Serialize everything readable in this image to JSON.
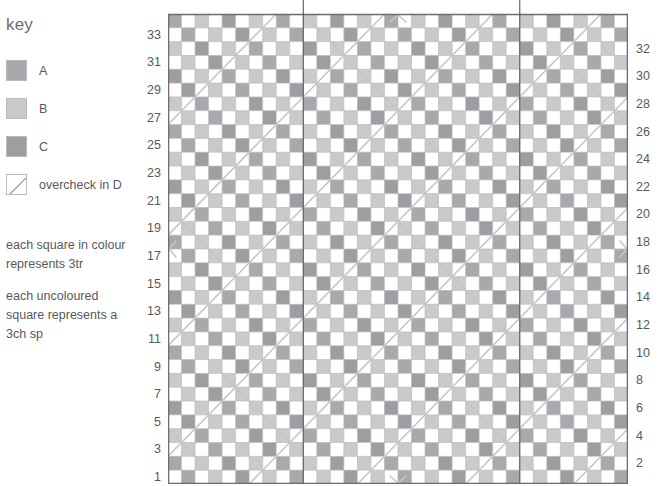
{
  "key": {
    "title": "key",
    "entries": [
      {
        "label": "A",
        "swatch": "color-swatch-a",
        "color": "#a7a9ac"
      },
      {
        "label": "B",
        "swatch": "color-swatch-b",
        "color": "#c9cacc"
      },
      {
        "label": "C",
        "swatch": "color-swatch-c",
        "color": "#9c9ea1"
      },
      {
        "label": "overcheck in D",
        "swatch": "diagonal-swatch-d",
        "color": "#ffffff"
      }
    ],
    "notes": [
      "each square in colour represents 3tr",
      "each uncoloured square represents a 3ch sp"
    ],
    "note_lines": [
      [
        "each square in colour",
        "represents 3tr"
      ],
      [
        "each uncoloured",
        "square represents a",
        "3ch sp"
      ]
    ]
  },
  "chart_data": {
    "type": "heatmap",
    "title": "",
    "xlabel": "",
    "ylabel": "",
    "grid": true,
    "legend_position": "left",
    "columns": 34,
    "rows": 34,
    "cell_size": 13.5,
    "row_labels_left": [
      33,
      31,
      29,
      27,
      25,
      23,
      21,
      19,
      17,
      15,
      13,
      11,
      9,
      7,
      5,
      3,
      1
    ],
    "row_labels_right": [
      32,
      30,
      28,
      26,
      24,
      22,
      20,
      18,
      16,
      14,
      12,
      10,
      8,
      6,
      4,
      2
    ],
    "row_label_step": 2,
    "palette": {
      "A": "#a7a9ac",
      "B": "#c9cacc",
      "C": "#9c9ea1",
      "empty": "#ffffff",
      "gridline": "#b9babc",
      "border": "#6d6e71",
      "overcheck_D": "#c4c6c8",
      "guideline": "#58595b"
    },
    "pattern": {
      "description": "checkerboard of coloured and uncoloured squares; coloured squares alternate between tones A, B and C in a repeating block",
      "block_period": 2,
      "tone_cycle": [
        "A",
        "B",
        "C",
        "B"
      ],
      "coloured_parity": "cell is coloured when (row + column) is even"
    },
    "overcheck": {
      "colour": "D",
      "line_color": "#c4c6c8",
      "line_width": 1.6,
      "spacing_cells": 8,
      "directions": [
        "down-right",
        "down-left"
      ],
      "forms_x_crossings_at": [
        {
          "col": 9,
          "row": 25
        },
        {
          "col": 25,
          "row": 25
        },
        {
          "col": 17,
          "row": 17
        },
        {
          "col": 9,
          "row": 9
        },
        {
          "col": 25,
          "row": 9
        }
      ],
      "arrow_markers": [
        {
          "x_cell": 0,
          "y_cell": 17,
          "glyph": "<"
        },
        {
          "x_cell": 34,
          "y_cell": 17,
          "glyph": ">"
        },
        {
          "x_cell": 17,
          "y_cell": 0,
          "glyph": "^"
        },
        {
          "x_cell": 17,
          "y_cell": 34,
          "glyph": "v"
        }
      ]
    },
    "guidelines": [
      {
        "orientation": "vertical",
        "column": 10
      },
      {
        "orientation": "vertical",
        "column": 26
      }
    ]
  }
}
